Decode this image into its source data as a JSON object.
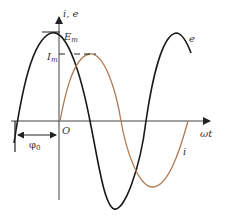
{
  "diagram": {
    "axes": {
      "y_label": "i, e",
      "x_label": "ωt",
      "origin_label": "O"
    },
    "labels": {
      "e_max": "E",
      "e_max_sub": "m",
      "i_max": "I",
      "i_max_sub": "m",
      "e_curve": "e",
      "i_curve": "i",
      "phase": "φ",
      "phase_sub": "0"
    },
    "colors": {
      "e_curve": "#1a1a1a",
      "i_curve": "#b07a55",
      "axes": "#333333"
    }
  }
}
